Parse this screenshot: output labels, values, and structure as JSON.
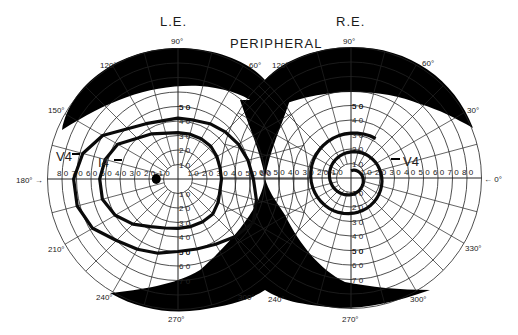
{
  "header": {
    "left_eye_label": "L.E.",
    "right_eye_label": "R.E.",
    "test_label": "PERIPHERAL"
  },
  "colors": {
    "background": "#ffffff",
    "grid": "#222222",
    "scotoma_fill": "#000000",
    "isopter": "#0a0a0a"
  },
  "chart_data": {
    "type": "polar_perimetry",
    "title": "PERIPHERAL",
    "scale_px_per_degree": 1.45,
    "ring_degrees": [
      10,
      20,
      30,
      40,
      50,
      60,
      70,
      80,
      90
    ],
    "meridian_degrees": [
      0,
      15,
      30,
      45,
      60,
      75,
      90,
      105,
      120,
      135,
      150,
      165,
      180,
      195,
      210,
      225,
      240,
      255,
      270,
      285,
      300,
      315,
      330,
      345
    ],
    "axis_labels_horizontal": [
      "80",
      "70",
      "60",
      "50",
      "40",
      "30",
      "20",
      "10"
    ],
    "axis_labels_vertical": [
      "10",
      "20",
      "30",
      "40",
      "50",
      "60",
      "70"
    ],
    "angle_labels": [
      "90°",
      "60°",
      "30°",
      "0°",
      "330°",
      "300°",
      "270°",
      "240°",
      "210°",
      "180°",
      "150°",
      "120°"
    ],
    "eyes": [
      {
        "id": "left",
        "label": "L.E.",
        "center": [
          178,
          179
        ],
        "radius_deg": 90,
        "angle_labels": [
          {
            "text": "90°",
            "x": 171,
            "y": 44
          },
          {
            "text": "120°",
            "x": 100,
            "y": 68
          },
          {
            "text": "60°",
            "x": 249,
            "y": 68
          },
          {
            "text": "150°",
            "x": 48,
            "y": 113
          },
          {
            "text": "180° →",
            "x": 16,
            "y": 183
          },
          {
            "text": "210°",
            "x": 48,
            "y": 252
          },
          {
            "text": "240°",
            "x": 96,
            "y": 300
          },
          {
            "text": "270°",
            "x": 168,
            "y": 322
          },
          {
            "text": "300°",
            "x": 238,
            "y": 300
          }
        ],
        "isopters": [
          {
            "name": "V4",
            "label_x": 56,
            "label_y": 161,
            "points_deg": [
              [
                90,
                42
              ],
              [
                120,
                44
              ],
              [
                150,
                60
              ],
              [
                165,
                68
              ],
              [
                180,
                72
              ],
              [
                195,
                72
              ],
              [
                210,
                68
              ],
              [
                225,
                60
              ],
              [
                240,
                56
              ],
              [
                255,
                53
              ],
              [
                270,
                50
              ],
              [
                285,
                50
              ],
              [
                300,
                52
              ],
              [
                315,
                56
              ],
              [
                330,
                60
              ],
              [
                345,
                56
              ],
              [
                0,
                52
              ],
              [
                15,
                50
              ],
              [
                30,
                48
              ],
              [
                45,
                46
              ],
              [
                60,
                44
              ],
              [
                75,
                42
              ]
            ]
          },
          {
            "name": "I4",
            "label_x": 98,
            "label_y": 167,
            "points_deg": [
              [
                90,
                32
              ],
              [
                120,
                36
              ],
              [
                150,
                48
              ],
              [
                165,
                52
              ],
              [
                180,
                54
              ],
              [
                195,
                54
              ],
              [
                210,
                50
              ],
              [
                225,
                44
              ],
              [
                240,
                38
              ],
              [
                255,
                35
              ],
              [
                270,
                34
              ],
              [
                285,
                34
              ],
              [
                300,
                34
              ],
              [
                315,
                34
              ],
              [
                330,
                32
              ],
              [
                345,
                30
              ],
              [
                0,
                30
              ],
              [
                15,
                30
              ],
              [
                30,
                31
              ],
              [
                45,
                32
              ],
              [
                60,
                32
              ],
              [
                75,
                32
              ]
            ]
          }
        ],
        "blind_spot": {
          "deg": 180,
          "ecc": 15,
          "rx": 4.5,
          "ry": 5
        }
      },
      {
        "id": "right",
        "label": "R.E.",
        "center": [
          351,
          178
        ],
        "radius_deg": 90,
        "angle_labels": [
          {
            "text": "90°",
            "x": 343,
            "y": 44
          },
          {
            "text": "120°",
            "x": 272,
            "y": 68
          },
          {
            "text": "60°",
            "x": 422,
            "y": 66
          },
          {
            "text": "30°",
            "x": 467,
            "y": 113
          },
          {
            "text": "← 0°",
            "x": 484,
            "y": 182
          },
          {
            "text": "330°",
            "x": 465,
            "y": 251
          },
          {
            "text": "300°",
            "x": 410,
            "y": 302
          },
          {
            "text": "270°",
            "x": 342,
            "y": 322
          },
          {
            "text": "240°",
            "x": 268,
            "y": 302
          }
        ],
        "isopters": [
          {
            "name": "V4",
            "label_x": 403,
            "label_y": 166,
            "spiral": true
          }
        ]
      }
    ]
  }
}
